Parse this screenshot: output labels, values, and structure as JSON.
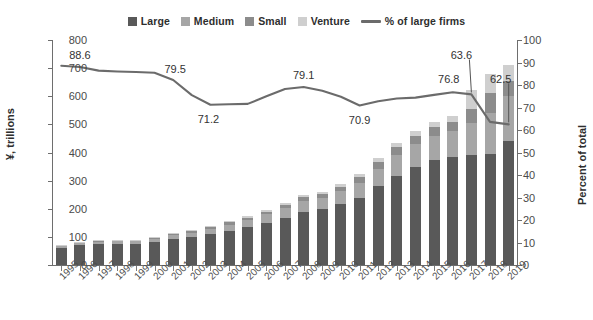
{
  "legend": {
    "items": [
      {
        "label": "Large",
        "color": "#595959",
        "type": "swatch"
      },
      {
        "label": "Medium",
        "color": "#a6a6a6",
        "type": "swatch"
      },
      {
        "label": "Small",
        "color": "#8c8c8c",
        "type": "swatch"
      },
      {
        "label": "Venture",
        "color": "#cfcfcf",
        "type": "swatch"
      },
      {
        "label": "% of large firms",
        "color": "#6b6b6b",
        "type": "line"
      }
    ]
  },
  "axes": {
    "left_title": "¥, trillions",
    "right_title": "Percent of total",
    "left_ticks": [
      "0",
      "100",
      "200",
      "300",
      "400",
      "500",
      "600",
      "700",
      "800"
    ],
    "right_ticks": [
      "0",
      "10",
      "20",
      "30",
      "40",
      "50",
      "60",
      "70",
      "80",
      "90",
      "100"
    ]
  },
  "chart_data": {
    "type": "bar",
    "title": "",
    "subtitle": "",
    "xlabel": "",
    "ylabel": "¥, trillions",
    "y2label": "Percent of total",
    "ylim": [
      0,
      800
    ],
    "y2lim": [
      0,
      100
    ],
    "grid": false,
    "legend_position": "top-center",
    "stacked": true,
    "categories": [
      "1995",
      "1996",
      "1997",
      "1998",
      "1999",
      "2000",
      "2001",
      "2002",
      "2003",
      "2004",
      "2005",
      "2006",
      "2007",
      "2008",
      "2009",
      "2010",
      "2011",
      "2012",
      "2013",
      "2014",
      "2015",
      "2016",
      "2017",
      "2018",
      "2019"
    ],
    "series": [
      {
        "name": "Large",
        "color": "#595959",
        "axis": "left",
        "values": [
          62,
          70,
          74,
          76,
          74,
          82,
          92,
          98,
          110,
          122,
          134,
          150,
          168,
          190,
          198,
          216,
          240,
          280,
          318,
          350,
          372,
          384,
          392,
          394,
          440
        ]
      },
      {
        "name": "Medium",
        "color": "#a6a6a6",
        "axis": "left",
        "values": [
          6,
          8,
          9,
          9,
          10,
          12,
          14,
          16,
          18,
          22,
          26,
          30,
          34,
          38,
          40,
          46,
          52,
          62,
          72,
          80,
          86,
          92,
          112,
          148,
          160
        ]
      },
      {
        "name": "Small",
        "color": "#8c8c8c",
        "axis": "left",
        "values": [
          2,
          3,
          3,
          3,
          4,
          4,
          5,
          6,
          6,
          8,
          8,
          10,
          12,
          14,
          14,
          16,
          20,
          24,
          28,
          30,
          32,
          34,
          52,
          68,
          56
        ]
      },
      {
        "name": "Venture",
        "color": "#cfcfcf",
        "axis": "left",
        "values": [
          2,
          2,
          2,
          2,
          2,
          2,
          3,
          4,
          4,
          4,
          6,
          6,
          8,
          8,
          8,
          10,
          12,
          14,
          16,
          18,
          18,
          20,
          68,
          70,
          56
        ]
      },
      {
        "name": "% of large firms",
        "color": "#6b6b6b",
        "axis": "right",
        "type": "line",
        "values": [
          88.6,
          88.0,
          86.4,
          86.0,
          85.8,
          85.4,
          82.2,
          75.5,
          71.2,
          71.4,
          71.6,
          75.0,
          78.2,
          79.1,
          77.4,
          74.8,
          70.9,
          72.8,
          74.0,
          74.4,
          75.6,
          76.8,
          75.8,
          63.6,
          62.5
        ]
      }
    ],
    "annotations": [
      {
        "text": "88.6",
        "category": "1996",
        "value": 88.6
      },
      {
        "text": "79.5",
        "category": "2001",
        "value": 79.5
      },
      {
        "text": "71.2",
        "category": "2003",
        "value": 71.2
      },
      {
        "text": "79.1",
        "category": "2008",
        "value": 79.1
      },
      {
        "text": "70.9",
        "category": "2011",
        "value": 70.9
      },
      {
        "text": "76.8",
        "category": "2016",
        "value": 76.8
      },
      {
        "text": "63.6",
        "category": "2017",
        "value": 63.6
      },
      {
        "text": "62.5",
        "category": "2019",
        "value": 62.5
      }
    ]
  }
}
